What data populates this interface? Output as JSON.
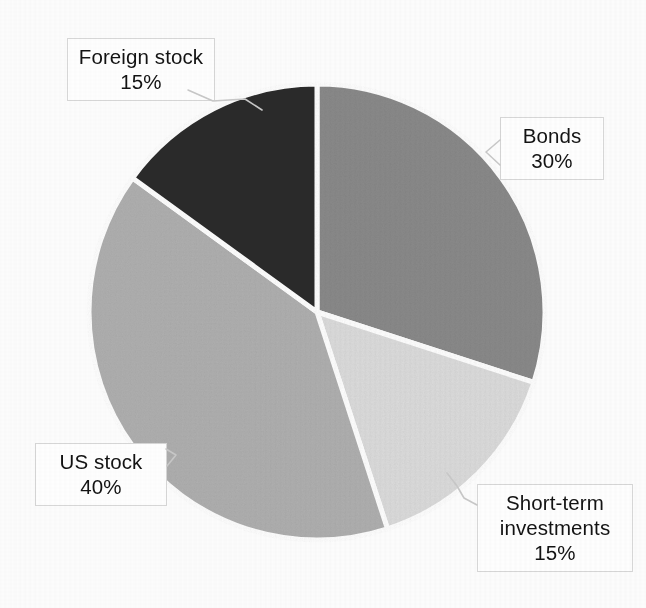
{
  "figure": {
    "background_color": "#fdfdfd",
    "type": "pie-chart-image"
  },
  "chart_data": {
    "type": "pie",
    "title": "",
    "subtitle": "",
    "xlabel": "",
    "ylabel": "",
    "legend_position": "none",
    "grid": false,
    "label_format": "name + percent",
    "start_angle_deg": 0,
    "direction": "clockwise",
    "total_percent": 100,
    "categories": [
      "Bonds",
      "Short-term investments",
      "US stock",
      "Foreign stock"
    ],
    "values": [
      30,
      15,
      40,
      15
    ],
    "slices": [
      {
        "name": "Bonds",
        "percent": 30,
        "percent_label": "30%",
        "color": "#8a8a8a",
        "start_angle_deg": 0,
        "end_angle_deg": 108
      },
      {
        "name": "Short-term investments",
        "percent": 15,
        "percent_label": "15%",
        "color": "#dcdcdc",
        "start_angle_deg": 108,
        "end_angle_deg": 162
      },
      {
        "name": "US stock",
        "percent": 40,
        "percent_label": "40%",
        "color": "#b0b0b0",
        "start_angle_deg": 162,
        "end_angle_deg": 306
      },
      {
        "name": "Foreign stock",
        "percent": 15,
        "percent_label": "15%",
        "color": "#2b2b2b",
        "start_angle_deg": 306,
        "end_angle_deg": 360
      }
    ]
  },
  "callouts": {
    "foreign_stock": {
      "name": "Foreign stock",
      "percent": "15%"
    },
    "bonds": {
      "name": "Bonds",
      "percent": "30%"
    },
    "short_term": {
      "name_line1": "Short-term",
      "name_line2": "investments",
      "percent": "15%"
    },
    "us_stock": {
      "name": "US stock",
      "percent": "40%"
    }
  }
}
